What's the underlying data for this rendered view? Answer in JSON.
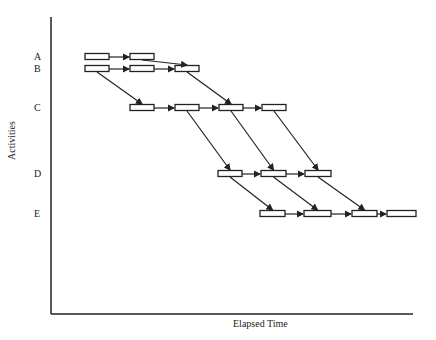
{
  "diagram": {
    "type": "line-of-balance / overlapping activity schedule",
    "xlabel": "Elapsed Time",
    "ylabel": "Activities",
    "rows": [
      {
        "label": "A",
        "y": 57,
        "boxes": [
          [
            85,
            109
          ],
          [
            130,
            154
          ]
        ]
      },
      {
        "label": "B",
        "y": 69,
        "boxes": [
          [
            85,
            109
          ],
          [
            130,
            154
          ],
          [
            175,
            199
          ]
        ]
      },
      {
        "label": "C",
        "y": 108,
        "boxes": [
          [
            130,
            154
          ],
          [
            175,
            199
          ],
          [
            219,
            243
          ],
          [
            262,
            286
          ]
        ]
      },
      {
        "label": "D",
        "y": 174,
        "boxes": [
          [
            218,
            242
          ],
          [
            261,
            286
          ],
          [
            305,
            331
          ]
        ]
      },
      {
        "label": "E",
        "y": 214,
        "boxes": [
          [
            260,
            285
          ],
          [
            304,
            331
          ],
          [
            352,
            377
          ],
          [
            387,
            416
          ]
        ]
      }
    ],
    "colors": {
      "line": "#222222",
      "background": "#ffffff"
    }
  }
}
